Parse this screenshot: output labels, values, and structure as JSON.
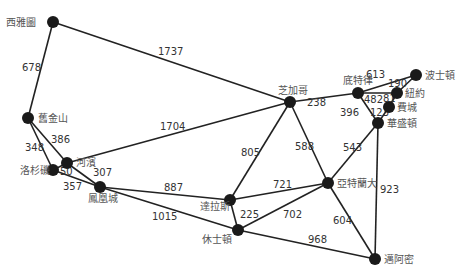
{
  "diagram": {
    "type": "weighted-undirected-graph",
    "node_color": "#1a1a1a",
    "edge_color": "#222222",
    "nodes": [
      {
        "id": "seattle",
        "label": "西雅圖",
        "x": 53,
        "y": 22,
        "lx": 6,
        "ly": 26,
        "anchor": "start"
      },
      {
        "id": "sanfrancisco",
        "label": "舊金山",
        "x": 28,
        "y": 118,
        "lx": 38,
        "ly": 122,
        "anchor": "start"
      },
      {
        "id": "riverside",
        "label": "河濱",
        "x": 67,
        "y": 163,
        "lx": 76,
        "ly": 166,
        "anchor": "start"
      },
      {
        "id": "losangeles",
        "label": "洛杉磯",
        "x": 53,
        "y": 170,
        "lx": 20,
        "ly": 174,
        "anchor": "start"
      },
      {
        "id": "phoenix",
        "label": "鳳凰城",
        "x": 100,
        "y": 187,
        "lx": 88,
        "ly": 202,
        "anchor": "start"
      },
      {
        "id": "dallas",
        "label": "達拉斯",
        "x": 230,
        "y": 200,
        "lx": 200,
        "ly": 210,
        "anchor": "start"
      },
      {
        "id": "houston",
        "label": "休士頓",
        "x": 238,
        "y": 230,
        "lx": 202,
        "ly": 243,
        "anchor": "start"
      },
      {
        "id": "chicago",
        "label": "芝加哥",
        "x": 290,
        "y": 102,
        "lx": 278,
        "ly": 94,
        "anchor": "start"
      },
      {
        "id": "detroit",
        "label": "底特律",
        "x": 358,
        "y": 93,
        "lx": 343,
        "ly": 84,
        "anchor": "start"
      },
      {
        "id": "boston",
        "label": "波士頓",
        "x": 416,
        "y": 75,
        "lx": 425,
        "ly": 79,
        "anchor": "start"
      },
      {
        "id": "newyork",
        "label": "紐約",
        "x": 397,
        "y": 93,
        "lx": 405,
        "ly": 97,
        "anchor": "start"
      },
      {
        "id": "philadelphia",
        "label": "費城",
        "x": 389,
        "y": 107,
        "lx": 397,
        "ly": 111,
        "anchor": "start"
      },
      {
        "id": "washington",
        "label": "華盛頓",
        "x": 378,
        "y": 123,
        "lx": 387,
        "ly": 127,
        "anchor": "start"
      },
      {
        "id": "atlanta",
        "label": "亞特蘭大",
        "x": 328,
        "y": 183,
        "lx": 337,
        "ly": 187,
        "anchor": "start"
      },
      {
        "id": "miami",
        "label": "邁阿密",
        "x": 375,
        "y": 259,
        "lx": 384,
        "ly": 263,
        "anchor": "start"
      }
    ],
    "edges": [
      {
        "from": "seattle",
        "to": "chicago",
        "weight": "1737",
        "lx": 158,
        "ly": 55
      },
      {
        "from": "seattle",
        "to": "sanfrancisco",
        "weight": "678",
        "lx": 22,
        "ly": 71
      },
      {
        "from": "sanfrancisco",
        "to": "riverside",
        "weight": "386",
        "lx": 51,
        "ly": 143
      },
      {
        "from": "sanfrancisco",
        "to": "losangeles",
        "weight": "348",
        "lx": 25,
        "ly": 151
      },
      {
        "from": "riverside",
        "to": "losangeles",
        "weight": "50",
        "lx": 60,
        "ly": 175
      },
      {
        "from": "riverside",
        "to": "chicago",
        "weight": "1704",
        "lx": 160,
        "ly": 130
      },
      {
        "from": "riverside",
        "to": "phoenix",
        "weight": "307",
        "lx": 93,
        "ly": 176
      },
      {
        "from": "losangeles",
        "to": "phoenix",
        "weight": "357",
        "lx": 63,
        "ly": 190
      },
      {
        "from": "phoenix",
        "to": "dallas",
        "weight": "887",
        "lx": 164,
        "ly": 191
      },
      {
        "from": "phoenix",
        "to": "houston",
        "weight": "1015",
        "lx": 152,
        "ly": 220
      },
      {
        "from": "dallas",
        "to": "chicago",
        "weight": "805",
        "lx": 241,
        "ly": 156
      },
      {
        "from": "dallas",
        "to": "atlanta",
        "weight": "721",
        "lx": 273,
        "ly": 188
      },
      {
        "from": "dallas",
        "to": "houston",
        "weight": "225",
        "lx": 240,
        "ly": 218
      },
      {
        "from": "houston",
        "to": "atlanta",
        "weight": "702",
        "lx": 283,
        "ly": 218
      },
      {
        "from": "houston",
        "to": "miami",
        "weight": "968",
        "lx": 308,
        "ly": 243
      },
      {
        "from": "chicago",
        "to": "detroit",
        "weight": "238",
        "lx": 307,
        "ly": 106
      },
      {
        "from": "chicago",
        "to": "atlanta",
        "weight": "588",
        "lx": 295,
        "ly": 150
      },
      {
        "from": "detroit",
        "to": "boston",
        "weight": "613",
        "lx": 366,
        "ly": 78
      },
      {
        "from": "detroit",
        "to": "newyork",
        "weight": "482",
        "lx": 364,
        "ly": 103
      },
      {
        "from": "detroit",
        "to": "washington",
        "weight": "396",
        "lx": 340,
        "ly": 116
      },
      {
        "from": "boston",
        "to": "newyork",
        "weight": "190",
        "lx": 388,
        "ly": 87
      },
      {
        "from": "newyork",
        "to": "philadelphia",
        "weight": "81",
        "lx": 383,
        "ly": 102
      },
      {
        "from": "philadelphia",
        "to": "washington",
        "weight": "123",
        "lx": 370,
        "ly": 116
      },
      {
        "from": "washington",
        "to": "atlanta",
        "weight": "543",
        "lx": 343,
        "ly": 151
      },
      {
        "from": "washington",
        "to": "miami",
        "weight": "923",
        "lx": 380,
        "ly": 193
      },
      {
        "from": "atlanta",
        "to": "miami",
        "weight": "604",
        "lx": 333,
        "ly": 224
      }
    ]
  }
}
